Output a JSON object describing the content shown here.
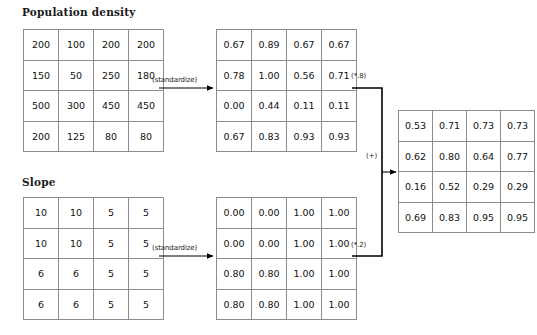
{
  "diagram": {
    "type": "weighted-overlay-flow",
    "sections": {
      "population": {
        "title": "Population density"
      },
      "slope": {
        "title": "Slope"
      }
    },
    "edges": {
      "standardize_top": "(standardize)",
      "standardize_bottom": "(standardize)",
      "weight_top": "(*.8)",
      "weight_bottom": "(*.2)",
      "sum": "(+)"
    },
    "matrices": {
      "population_input": {
        "name": "population-density-input",
        "rows": [
          [
            "200",
            "100",
            "200",
            "200"
          ],
          [
            "150",
            "50",
            "250",
            "180"
          ],
          [
            "500",
            "300",
            "450",
            "450"
          ],
          [
            "200",
            "125",
            "80",
            "80"
          ]
        ]
      },
      "population_standardized": {
        "name": "population-density-standardized",
        "rows": [
          [
            "0.67",
            "0.89",
            "0.67",
            "0.67"
          ],
          [
            "0.78",
            "1.00",
            "0.56",
            "0.71"
          ],
          [
            "0.00",
            "0.44",
            "0.11",
            "0.11"
          ],
          [
            "0.67",
            "0.83",
            "0.93",
            "0.93"
          ]
        ]
      },
      "slope_input": {
        "name": "slope-input",
        "rows": [
          [
            "10",
            "10",
            "5",
            "5"
          ],
          [
            "10",
            "10",
            "5",
            "5"
          ],
          [
            "6",
            "6",
            "5",
            "5"
          ],
          [
            "6",
            "6",
            "5",
            "5"
          ]
        ]
      },
      "slope_standardized": {
        "name": "slope-standardized",
        "rows": [
          [
            "0.00",
            "0.00",
            "1.00",
            "1.00"
          ],
          [
            "0.00",
            "0.00",
            "1.00",
            "1.00"
          ],
          [
            "0.80",
            "0.80",
            "1.00",
            "1.00"
          ],
          [
            "0.80",
            "0.80",
            "1.00",
            "1.00"
          ]
        ]
      },
      "result": {
        "name": "weighted-sum-result",
        "rows": [
          [
            "0.53",
            "0.71",
            "0.73",
            "0.73"
          ],
          [
            "0.62",
            "0.80",
            "0.64",
            "0.77"
          ],
          [
            "0.16",
            "0.52",
            "0.29",
            "0.29"
          ],
          [
            "0.69",
            "0.83",
            "0.95",
            "0.95"
          ]
        ]
      }
    },
    "colors": {
      "grid_line": "#8d8d8d",
      "text": "#111111",
      "connector": "#000000",
      "background": "#ffffff"
    }
  }
}
